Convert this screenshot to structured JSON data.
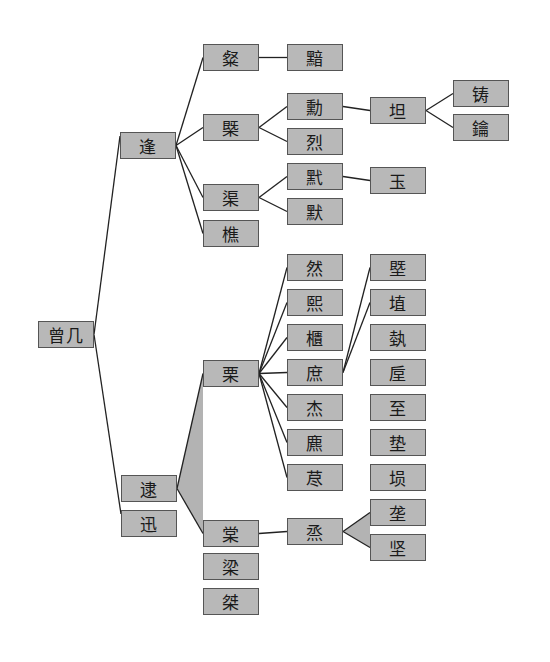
{
  "diagram": {
    "type": "genealogy-tree",
    "colors": {
      "node_fill": "#b8b8b8",
      "node_border": "#3a3a3a",
      "edge": "#222222",
      "band_fill": "#b3b3b3",
      "background": "#ffffff"
    },
    "nodes": [
      {
        "id": "n_zengji",
        "label": "曾几"
      },
      {
        "id": "n_feng",
        "label": "逢"
      },
      {
        "id": "n_dai",
        "label": "逮"
      },
      {
        "id": "n_xun",
        "label": "迅"
      },
      {
        "id": "n_can",
        "label": "粲"
      },
      {
        "id": "n_gai",
        "label": "槩"
      },
      {
        "id": "n_qu",
        "label": "渠"
      },
      {
        "id": "n_qiao",
        "label": "樵"
      },
      {
        "id": "n_li",
        "label": "栗"
      },
      {
        "id": "n_tang",
        "label": "棠"
      },
      {
        "id": "n_liang",
        "label": "梁"
      },
      {
        "id": "n_jie",
        "label": "桀"
      },
      {
        "id": "n_an",
        "label": "黯"
      },
      {
        "id": "n_xun2",
        "label": "勳"
      },
      {
        "id": "n_lie",
        "label": "烈"
      },
      {
        "id": "n_yi",
        "label": "黓"
      },
      {
        "id": "n_mo",
        "label": "默"
      },
      {
        "id": "n_ran",
        "label": "然"
      },
      {
        "id": "n_xi",
        "label": "熙"
      },
      {
        "id": "n_gui",
        "label": "櫃"
      },
      {
        "id": "n_shu",
        "label": "庶"
      },
      {
        "id": "n_jie2",
        "label": "杰"
      },
      {
        "id": "n_biao",
        "label": "麃"
      },
      {
        "id": "n_jin",
        "label": "荩"
      },
      {
        "id": "n_zheng",
        "label": "烝"
      },
      {
        "id": "n_tan",
        "label": "坦"
      },
      {
        "id": "n_yu",
        "label": "玉"
      },
      {
        "id": "n_ji",
        "label": "塈"
      },
      {
        "id": "n_zhi",
        "label": "埴"
      },
      {
        "id": "n_yi2",
        "label": "埶"
      },
      {
        "id": "n_hou",
        "label": "垕"
      },
      {
        "id": "n_zhi2",
        "label": "至"
      },
      {
        "id": "n_dian",
        "label": "垫"
      },
      {
        "id": "n_xun3",
        "label": "埙"
      },
      {
        "id": "n_long",
        "label": "垄"
      },
      {
        "id": "n_jian",
        "label": "坚"
      },
      {
        "id": "n_zhu",
        "label": "铸"
      },
      {
        "id": "n_yue",
        "label": "鑰"
      }
    ],
    "edges": [
      [
        "n_zengji",
        "n_feng"
      ],
      [
        "n_zengji",
        "n_xun"
      ],
      [
        "n_feng",
        "n_can"
      ],
      [
        "n_feng",
        "n_gai"
      ],
      [
        "n_feng",
        "n_qu"
      ],
      [
        "n_feng",
        "n_qiao"
      ],
      [
        "n_can",
        "n_an"
      ],
      [
        "n_gai",
        "n_xun2"
      ],
      [
        "n_gai",
        "n_lie"
      ],
      [
        "n_xun2",
        "n_tan"
      ],
      [
        "n_tan",
        "n_zhu"
      ],
      [
        "n_tan",
        "n_yue"
      ],
      [
        "n_qu",
        "n_yi"
      ],
      [
        "n_qu",
        "n_mo"
      ],
      [
        "n_yi",
        "n_yu"
      ],
      [
        "n_dai",
        "n_li"
      ],
      [
        "n_dai",
        "n_tang"
      ],
      [
        "n_li",
        "n_ran"
      ],
      [
        "n_li",
        "n_xi"
      ],
      [
        "n_li",
        "n_gui"
      ],
      [
        "n_li",
        "n_shu"
      ],
      [
        "n_li",
        "n_jie2"
      ],
      [
        "n_li",
        "n_biao"
      ],
      [
        "n_li",
        "n_jin"
      ],
      [
        "n_shu",
        "n_ji"
      ],
      [
        "n_shu",
        "n_zhi"
      ],
      [
        "n_tang",
        "n_zheng"
      ],
      [
        "n_zheng",
        "n_long"
      ],
      [
        "n_zheng",
        "n_jian"
      ]
    ],
    "bands": [
      {
        "from": "n_dai",
        "to": [
          "n_li",
          "n_tang"
        ]
      },
      {
        "from": "n_zheng",
        "to": [
          "n_long",
          "n_jian"
        ]
      }
    ]
  }
}
